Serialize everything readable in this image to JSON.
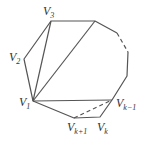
{
  "diagram": {
    "type": "polygon-triangulation",
    "stroke_color": "#555555",
    "vertices": [
      {
        "id": "V1",
        "base": "V",
        "sub": "1",
        "x": 33,
        "y": 101
      },
      {
        "id": "V2",
        "base": "V",
        "sub": "2",
        "x": 24,
        "y": 59
      },
      {
        "id": "V3",
        "base": "V",
        "sub": "3",
        "x": 51,
        "y": 21
      },
      {
        "id": "V4",
        "base": "",
        "sub": "",
        "x": 95,
        "y": 21
      },
      {
        "id": "V5",
        "base": "",
        "sub": "",
        "x": 117,
        "y": 33
      },
      {
        "id": "V6",
        "base": "",
        "sub": "",
        "x": 128,
        "y": 52
      },
      {
        "id": "V7",
        "base": "",
        "sub": "",
        "x": 127,
        "y": 76
      },
      {
        "id": "Vk-1",
        "base": "V",
        "sub": "k−1",
        "x": 112,
        "y": 100
      },
      {
        "id": "Vk",
        "base": "V",
        "sub": "k",
        "x": 100,
        "y": 117
      },
      {
        "id": "Vk+1",
        "base": "V",
        "sub": "k+1",
        "x": 74,
        "y": 118
      }
    ],
    "labels": {
      "v1": {
        "base": "V",
        "sub": "1"
      },
      "v2": {
        "base": "V",
        "sub": "2"
      },
      "v3": {
        "base": "V",
        "sub": "3"
      },
      "vk_minus_1": {
        "base": "V",
        "sub": "k−1"
      },
      "vk": {
        "base": "V",
        "sub": "k"
      },
      "vk_plus_1": {
        "base": "V",
        "sub": "k+1"
      }
    }
  }
}
